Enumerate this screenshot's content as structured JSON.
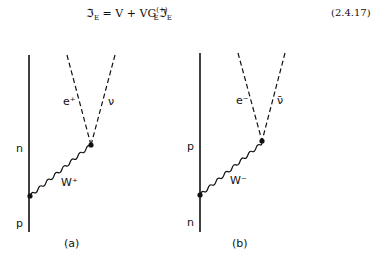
{
  "equation": {
    "lhs": "ℑ",
    "lhs_sub": "E",
    "eq": " = V + VG",
    "g_sub": "E",
    "g_sup": "(+)",
    "rhs": "ℑ",
    "rhs_sub": "E",
    "number": "(2.4.17)"
  },
  "diagrams": [
    {
      "caption": "(a)",
      "upper_nucleon": "n",
      "lower_nucleon": "p",
      "boson": "W⁺",
      "lepton_left": "e⁺",
      "lepton_right": "ν"
    },
    {
      "caption": "(b)",
      "upper_nucleon": "p",
      "lower_nucleon": "n",
      "boson": "W⁻",
      "lepton_left": "e⁻",
      "lepton_right": "ν̄"
    }
  ]
}
